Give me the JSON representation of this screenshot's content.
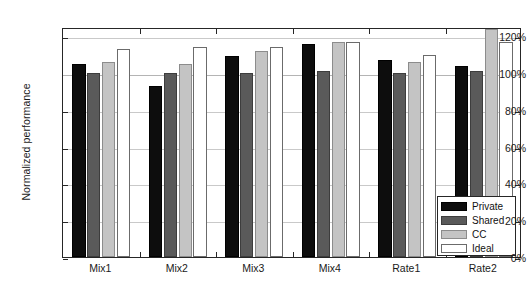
{
  "chart_data": {
    "type": "bar",
    "title": "",
    "xlabel": "",
    "ylabel": "Normalized performance",
    "categories": [
      "Mix1",
      "Mix2",
      "Mix3",
      "Mix4",
      "Rate1",
      "Rate2"
    ],
    "series": [
      {
        "name": "Private",
        "color": "#0d0d0d",
        "values": [
          105,
          93,
          109,
          116,
          107,
          104
        ]
      },
      {
        "name": "Shared",
        "color": "#5a5a5a",
        "values": [
          100,
          100,
          100,
          101,
          100,
          101
        ]
      },
      {
        "name": "CC",
        "color": "#c4c4c4",
        "values": [
          106,
          105,
          112,
          117,
          106,
          124
        ]
      },
      {
        "name": "Ideal",
        "color": "#ffffff",
        "values": [
          113,
          114,
          114,
          117,
          110,
          117
        ]
      }
    ],
    "ylim": [
      0,
      125
    ],
    "ytick_values": [
      0,
      20,
      40,
      60,
      80,
      100,
      120
    ],
    "ytick_labels": [
      "0%",
      "20%",
      "40%",
      "60%",
      "80%",
      "100%",
      "120%"
    ],
    "grid": true,
    "grid_axis": "y",
    "legend_position": "lower-right",
    "reference_line": 100
  }
}
